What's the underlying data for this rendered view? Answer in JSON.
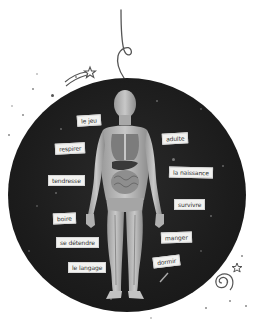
{
  "illustration": {
    "subject": "human anatomy figure inside dark cosmic circle with word labels",
    "colors": {
      "background": "#ffffff",
      "circle": "#1c1c1c",
      "label_bg": "#f2f2f0",
      "label_text": "#333333",
      "doodle_line": "#555555"
    },
    "labels": [
      {
        "id": "le-jeu",
        "text": "le jeu"
      },
      {
        "id": "respirer",
        "text": "respirer"
      },
      {
        "id": "adulte",
        "text": "adulte"
      },
      {
        "id": "la-naissance",
        "text": "la naissance"
      },
      {
        "id": "tendresse",
        "text": "tendresse"
      },
      {
        "id": "survivre",
        "text": "survivre"
      },
      {
        "id": "boire",
        "text": "boire"
      },
      {
        "id": "se-detendre",
        "text": "se détendre"
      },
      {
        "id": "manger",
        "text": "manger"
      },
      {
        "id": "dormir",
        "text": "dormir"
      },
      {
        "id": "le-langage",
        "text": "le langage"
      }
    ],
    "decorations": [
      "hanging-string-icon",
      "shooting-star-icon",
      "spiral-galaxy-icon",
      "small-star-icon"
    ]
  }
}
